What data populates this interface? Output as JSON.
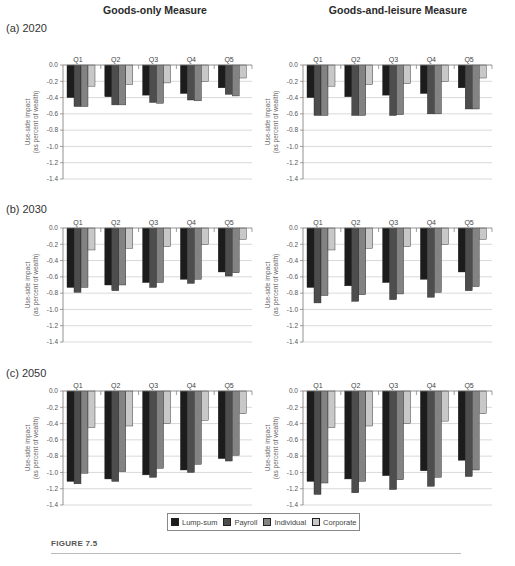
{
  "column_titles": [
    "Goods-only Measure",
    "Goods-and-leisure Measure"
  ],
  "row_labels": [
    "(a) 2020",
    "(b) 2030",
    "(c) 2050"
  ],
  "figure_label": "FIGURE 7.5",
  "legend": [
    {
      "name": "Lump-sum",
      "color": "#1c1c1c"
    },
    {
      "name": "Payroll",
      "color": "#4d4d4d"
    },
    {
      "name": "Individual",
      "color": "#838383"
    },
    {
      "name": "Corporate",
      "color": "#c8c8c8"
    }
  ],
  "chart_data": [
    {
      "type": "bar",
      "panel": "(a) 2020",
      "title": "Goods-only Measure",
      "categories": [
        "Q1",
        "Q2",
        "Q3",
        "Q4",
        "Q5"
      ],
      "ylabel": "Use-side impact (as percent of wealth)",
      "xlabel": "",
      "ylim": [
        -1.4,
        0.0
      ],
      "yticks": [
        0.0,
        -0.2,
        -0.4,
        -0.6,
        -0.8,
        -1.0,
        -1.2,
        -1.4
      ],
      "grid": true,
      "series": [
        {
          "name": "Lump-sum",
          "values": [
            -0.4,
            -0.39,
            -0.37,
            -0.35,
            -0.28
          ]
        },
        {
          "name": "Payroll",
          "values": [
            -0.51,
            -0.49,
            -0.46,
            -0.43,
            -0.36
          ]
        },
        {
          "name": "Individual",
          "values": [
            -0.51,
            -0.49,
            -0.47,
            -0.44,
            -0.38
          ]
        },
        {
          "name": "Corporate",
          "values": [
            -0.26,
            -0.24,
            -0.22,
            -0.2,
            -0.16
          ]
        }
      ]
    },
    {
      "type": "bar",
      "panel": "(a) 2020",
      "title": "Goods-and-leisure Measure",
      "categories": [
        "Q1",
        "Q2",
        "Q3",
        "Q4",
        "Q5"
      ],
      "ylabel": "Use-side impact (as percent of wealth)",
      "xlabel": "",
      "ylim": [
        -1.4,
        0.0
      ],
      "yticks": [
        0.0,
        -0.2,
        -0.4,
        -0.6,
        -0.8,
        -1.0,
        -1.2,
        -1.4
      ],
      "grid": true,
      "series": [
        {
          "name": "Lump-sum",
          "values": [
            -0.4,
            -0.39,
            -0.37,
            -0.35,
            -0.28
          ]
        },
        {
          "name": "Payroll",
          "values": [
            -0.62,
            -0.62,
            -0.62,
            -0.6,
            -0.54
          ]
        },
        {
          "name": "Individual",
          "values": [
            -0.62,
            -0.62,
            -0.61,
            -0.6,
            -0.54
          ]
        },
        {
          "name": "Corporate",
          "values": [
            -0.26,
            -0.24,
            -0.23,
            -0.2,
            -0.16
          ]
        }
      ]
    },
    {
      "type": "bar",
      "panel": "(b) 2030",
      "title": "Goods-only Measure",
      "categories": [
        "Q1",
        "Q2",
        "Q3",
        "Q4",
        "Q5"
      ],
      "ylabel": "Use-side impact (as percent of wealth)",
      "xlabel": "",
      "ylim": [
        -1.4,
        0.0
      ],
      "yticks": [
        0.0,
        -0.2,
        -0.4,
        -0.6,
        -0.8,
        -1.0,
        -1.2,
        -1.4
      ],
      "grid": true,
      "series": [
        {
          "name": "Lump-sum",
          "values": [
            -0.73,
            -0.7,
            -0.67,
            -0.63,
            -0.54
          ]
        },
        {
          "name": "Payroll",
          "values": [
            -0.79,
            -0.77,
            -0.73,
            -0.68,
            -0.59
          ]
        },
        {
          "name": "Individual",
          "values": [
            -0.73,
            -0.7,
            -0.67,
            -0.63,
            -0.55
          ]
        },
        {
          "name": "Corporate",
          "values": [
            -0.27,
            -0.25,
            -0.23,
            -0.2,
            -0.14
          ]
        }
      ]
    },
    {
      "type": "bar",
      "panel": "(b) 2030",
      "title": "Goods-and-leisure Measure",
      "categories": [
        "Q1",
        "Q2",
        "Q3",
        "Q4",
        "Q5"
      ],
      "ylabel": "Use-side impact (as percent of wealth)",
      "xlabel": "",
      "ylim": [
        -1.4,
        0.0
      ],
      "yticks": [
        0.0,
        -0.2,
        -0.4,
        -0.6,
        -0.8,
        -1.0,
        -1.2,
        -1.4
      ],
      "grid": true,
      "series": [
        {
          "name": "Lump-sum",
          "values": [
            -0.73,
            -0.71,
            -0.67,
            -0.63,
            -0.54
          ]
        },
        {
          "name": "Payroll",
          "values": [
            -0.92,
            -0.9,
            -0.88,
            -0.85,
            -0.77
          ]
        },
        {
          "name": "Individual",
          "values": [
            -0.83,
            -0.82,
            -0.81,
            -0.79,
            -0.72
          ]
        },
        {
          "name": "Corporate",
          "values": [
            -0.27,
            -0.25,
            -0.23,
            -0.2,
            -0.14
          ]
        }
      ]
    },
    {
      "type": "bar",
      "panel": "(c) 2050",
      "title": "Goods-only Measure",
      "categories": [
        "Q1",
        "Q2",
        "Q3",
        "Q4",
        "Q5"
      ],
      "ylabel": "Use-side impact (as percent of wealth)",
      "xlabel": "",
      "ylim": [
        -1.4,
        0.0
      ],
      "yticks": [
        0.0,
        -0.2,
        -0.4,
        -0.6,
        -0.8,
        -1.0,
        -1.2,
        -1.4
      ],
      "grid": true,
      "series": [
        {
          "name": "Lump-sum",
          "values": [
            -1.11,
            -1.08,
            -1.03,
            -0.97,
            -0.83
          ]
        },
        {
          "name": "Payroll",
          "values": [
            -1.14,
            -1.11,
            -1.06,
            -1.0,
            -0.86
          ]
        },
        {
          "name": "Individual",
          "values": [
            -1.01,
            -0.99,
            -0.95,
            -0.9,
            -0.79
          ]
        },
        {
          "name": "Corporate",
          "values": [
            -0.45,
            -0.43,
            -0.4,
            -0.36,
            -0.28
          ]
        }
      ]
    },
    {
      "type": "bar",
      "panel": "(c) 2050",
      "title": "Goods-and-leisure Measure",
      "categories": [
        "Q1",
        "Q2",
        "Q3",
        "Q4",
        "Q5"
      ],
      "ylabel": "Use-side impact (as percent of wealth)",
      "xlabel": "",
      "ylim": [
        -1.4,
        0.0
      ],
      "yticks": [
        0.0,
        -0.2,
        -0.4,
        -0.6,
        -0.8,
        -1.0,
        -1.2,
        -1.4
      ],
      "grid": true,
      "series": [
        {
          "name": "Lump-sum",
          "values": [
            -1.11,
            -1.08,
            -1.04,
            -0.98,
            -0.85
          ]
        },
        {
          "name": "Payroll",
          "values": [
            -1.27,
            -1.25,
            -1.21,
            -1.17,
            -1.05
          ]
        },
        {
          "name": "Individual",
          "values": [
            -1.13,
            -1.11,
            -1.09,
            -1.06,
            -0.97
          ]
        },
        {
          "name": "Corporate",
          "values": [
            -0.45,
            -0.43,
            -0.4,
            -0.37,
            -0.28
          ]
        }
      ]
    }
  ]
}
